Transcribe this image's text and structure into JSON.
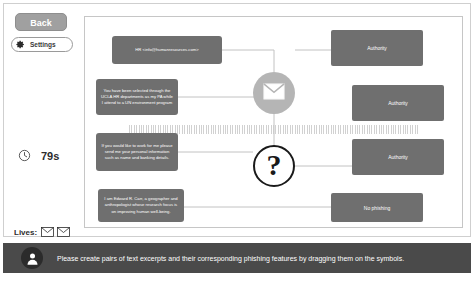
{
  "hud": {
    "back_label": "Back",
    "settings_label": "Settings",
    "gear_icon": "gear-icon",
    "clock_icon": "clock-icon",
    "timer_value": "79s",
    "lives_label": "Lives:",
    "lives": [
      "envelope-icon",
      "envelope-icon"
    ],
    "lives_count": 2
  },
  "board": {
    "excerpts": [
      {
        "text": "HR <info@humanresources.com>"
      },
      {
        "text": "You have been selected through the UCLA HR departments as my PA while I attend to a UN environment program"
      },
      {
        "text": "If you would like to work for me please send me your personal information such as name and banking details."
      },
      {
        "text": "I am Edward R. Carr, a geographer and anthropologist whose research focus is on improving human well-being."
      }
    ],
    "features": [
      {
        "label": "Authority"
      },
      {
        "label": "Authority"
      },
      {
        "label": "Authority"
      },
      {
        "label": "No phishing"
      }
    ],
    "symbols": [
      {
        "name": "envelope-symbol",
        "glyph": "envelope-icon"
      },
      {
        "name": "question-symbol",
        "glyph": "?"
      }
    ]
  },
  "instruction": {
    "avatar_icon": "avatar-icon",
    "text": "Please create pairs of text excerpts and their corresponding phishing features by dragging them on the symbols."
  },
  "colors": {
    "card_gray": "#6f6f6f",
    "button_gray": "#a0a0a0",
    "symbol_gray": "#b5b5b5",
    "bar_dark": "#4a4a4a",
    "frame_border": "#c6c6c6"
  }
}
